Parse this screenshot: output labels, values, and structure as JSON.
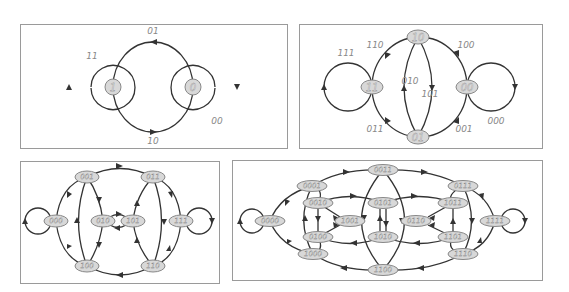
{
  "figure": {
    "panels": [
      {
        "id": "de-bruijn-1",
        "nodes": [
          {
            "label": "1",
            "x": 113,
            "y": 87
          },
          {
            "label": "0",
            "x": 193,
            "y": 87
          }
        ],
        "edge_labels": [
          {
            "text": "11",
            "x": 92,
            "y": 56
          },
          {
            "text": "01",
            "x": 153,
            "y": 38
          },
          {
            "text": "00",
            "x": 217,
            "y": 121
          },
          {
            "text": "10",
            "x": 153,
            "y": 138
          }
        ]
      },
      {
        "id": "de-bruijn-2",
        "nodes": [
          {
            "label": "10",
            "x": 418,
            "y": 37
          },
          {
            "label": "11",
            "x": 372,
            "y": 87
          },
          {
            "label": "00",
            "x": 467,
            "y": 87
          },
          {
            "label": "01",
            "x": 418,
            "y": 137
          }
        ],
        "edge_labels": [
          {
            "text": "111",
            "x": 346,
            "y": 53
          },
          {
            "text": "110",
            "x": 375,
            "y": 45
          },
          {
            "text": "100",
            "x": 466,
            "y": 45
          },
          {
            "text": "010",
            "x": 408,
            "y": 82
          },
          {
            "text": "101",
            "x": 431,
            "y": 91
          },
          {
            "text": "011",
            "x": 376,
            "y": 129
          },
          {
            "text": "001",
            "x": 463,
            "y": 129
          },
          {
            "text": "000",
            "x": 496,
            "y": 121
          }
        ]
      },
      {
        "id": "de-bruijn-3",
        "nodes": [
          {
            "label": "001",
            "x": 87,
            "y": 177
          },
          {
            "label": "011",
            "x": 153,
            "y": 177
          },
          {
            "label": "000",
            "x": 56,
            "y": 221
          },
          {
            "label": "010",
            "x": 103,
            "y": 221
          },
          {
            "label": "101",
            "x": 133,
            "y": 221
          },
          {
            "label": "111",
            "x": 181,
            "y": 221
          },
          {
            "label": "100",
            "x": 87,
            "y": 266
          },
          {
            "label": "110",
            "x": 153,
            "y": 266
          }
        ]
      },
      {
        "id": "de-bruijn-4",
        "nodes": [
          {
            "label": "0011",
            "x": 383,
            "y": 170
          },
          {
            "label": "0001",
            "x": 312,
            "y": 186
          },
          {
            "label": "0111",
            "x": 463,
            "y": 186
          },
          {
            "label": "0010",
            "x": 318,
            "y": 203
          },
          {
            "label": "0101",
            "x": 383,
            "y": 203
          },
          {
            "label": "1011",
            "x": 453,
            "y": 203
          },
          {
            "label": "0000",
            "x": 270,
            "y": 221
          },
          {
            "label": "1001",
            "x": 350,
            "y": 221
          },
          {
            "label": "0110",
            "x": 416,
            "y": 221
          },
          {
            "label": "1111",
            "x": 495,
            "y": 221
          },
          {
            "label": "0100",
            "x": 318,
            "y": 237
          },
          {
            "label": "1010",
            "x": 383,
            "y": 237
          },
          {
            "label": "1101",
            "x": 453,
            "y": 237
          },
          {
            "label": "1000",
            "x": 313,
            "y": 254
          },
          {
            "label": "1110",
            "x": 463,
            "y": 254
          },
          {
            "label": "1100",
            "x": 383,
            "y": 270
          }
        ]
      }
    ]
  }
}
